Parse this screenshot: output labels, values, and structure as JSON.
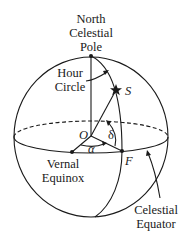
{
  "diagram": {
    "labels": {
      "north_pole_line1": "North",
      "north_pole_line2": "Celestial",
      "north_pole_line3": "Pole",
      "hour_circle_line1": "Hour",
      "hour_circle_line2": "Circle",
      "star": "S",
      "origin": "O",
      "declination": "δ",
      "right_ascension": "α",
      "foot_point": "F",
      "vernal_equinox_line1": "Vernal",
      "vernal_equinox_line2": "Equinox",
      "celestial_equator_line1": "Celestial",
      "celestial_equator_line2": "Equator"
    },
    "nodes": [
      {
        "id": "north-celestial-pole",
        "label": "North Celestial Pole",
        "x": 91,
        "y": 56
      },
      {
        "id": "origin",
        "label": "O",
        "x": 91,
        "y": 136
      },
      {
        "id": "star",
        "label": "S",
        "x": 116,
        "y": 90
      },
      {
        "id": "foot",
        "label": "F",
        "x": 122,
        "y": 151
      },
      {
        "id": "vernal-equinox",
        "label": "Vernal Equinox",
        "x": 72,
        "y": 152
      }
    ],
    "edges": [
      {
        "from": "origin",
        "to": "north-celestial-pole",
        "kind": "axis"
      },
      {
        "from": "origin",
        "to": "star",
        "kind": "radius"
      },
      {
        "from": "origin",
        "to": "foot",
        "kind": "radius"
      },
      {
        "from": "origin",
        "to": "vernal-equinox",
        "kind": "radius"
      },
      {
        "from": "north-celestial-pole",
        "to": "foot",
        "kind": "hour-circle",
        "via": "star"
      }
    ],
    "angles": [
      {
        "name": "declination",
        "symbol": "δ",
        "between": [
          "foot",
          "star"
        ]
      },
      {
        "name": "right ascension",
        "symbol": "α",
        "between": [
          "vernal-equinox",
          "foot"
        ]
      }
    ]
  }
}
